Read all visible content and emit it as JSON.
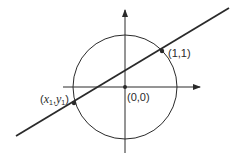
{
  "diagram": {
    "colors": {
      "stroke": "#2a2a2a",
      "background": "#ffffff"
    },
    "circle": {
      "cx": 125,
      "cy": 87,
      "r": 52
    },
    "axes": {
      "horizontal": {
        "x1": 63,
        "x2": 200,
        "y": 87
      },
      "vertical": {
        "x": 125,
        "y1": 153,
        "y2": 10
      }
    },
    "line": {
      "x1": 16,
      "y1": 136,
      "x2": 229,
      "y2": 8
    },
    "points": [
      {
        "id": "origin",
        "cx": 125,
        "cy": 87,
        "label": "(0,0)"
      },
      {
        "id": "p11",
        "cx": 162,
        "cy": 51,
        "label": "(1,1)"
      },
      {
        "id": "px1y1",
        "cx": 74,
        "cy": 103,
        "label_x": "x",
        "label_x_sub": "1",
        "label_y": "y",
        "label_y_sub": "1"
      }
    ],
    "labels": {
      "origin": "(0,0)",
      "p11": "(1,1)",
      "open_paren": "(",
      "comma": ",",
      "close_paren": ")",
      "x": "x",
      "x_sub": "1",
      "y": "y",
      "y_sub": "1"
    }
  }
}
